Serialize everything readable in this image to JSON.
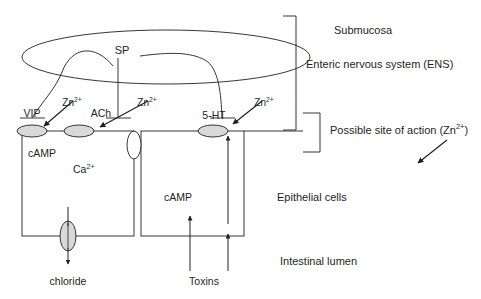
{
  "figure": {
    "type": "biological-schematic",
    "line_color": "#231f20",
    "text_color": "#231f20",
    "receptor_fill": "#d9d9d9",
    "channel_fill": "#d9d9d9",
    "background": "#ffffff"
  },
  "regions": {
    "submucosa": "Submucosa",
    "ens": "Enteric nervous system (ENS)",
    "epithelial": "Epithelial cells",
    "lumen": "Intestinal lumen",
    "site_of_action": "Possible site of action (Zn",
    "site_of_action_sup": "2+",
    "site_of_action_tail": ")"
  },
  "neuron": {
    "label": "SP"
  },
  "receptors": [
    {
      "id": "vip",
      "label": "VIP",
      "x": 32,
      "y": 131
    },
    {
      "id": "ach",
      "label": "ACh",
      "x": 79,
      "y": 131
    },
    {
      "id": "5ht",
      "label": "5-HT",
      "x": 213,
      "y": 131
    }
  ],
  "zinc": {
    "symbol": "Zn",
    "charge": "2+",
    "markers": [
      {
        "id": "zn-vip",
        "x": 72,
        "y": 104
      },
      {
        "id": "zn-ach",
        "x": 145,
        "y": 104
      },
      {
        "id": "zn-5ht",
        "x": 262,
        "y": 104
      }
    ]
  },
  "cells": {
    "left": {
      "messengers": [
        {
          "id": "camp-left",
          "label": "cAMP"
        },
        {
          "id": "calcium",
          "label": "Ca",
          "sup": "2+"
        }
      ]
    },
    "right": {
      "messengers": [
        {
          "id": "camp-right",
          "label": "cAMP"
        }
      ]
    }
  },
  "transport": {
    "chloride": "chloride",
    "toxins": "Toxins"
  }
}
